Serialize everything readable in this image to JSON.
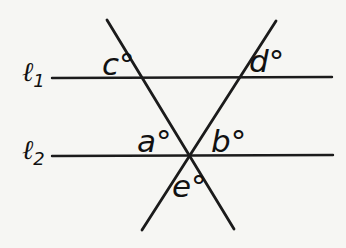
{
  "figure": {
    "canvas": {
      "width": 346,
      "height": 248,
      "background": "#f6f6f3",
      "ink": "#1b1b1b"
    },
    "parallel_lines": [
      {
        "name": "parallel-line-l1",
        "x1": 52,
        "y1": 78,
        "x2": 332,
        "y2": 77,
        "width": 2.4
      },
      {
        "name": "parallel-line-l2",
        "x1": 52,
        "y1": 156,
        "x2": 333,
        "y2": 155,
        "width": 2.4
      }
    ],
    "transversals": [
      {
        "name": "transversal-left",
        "x1": 107,
        "y1": 20,
        "x2": 234,
        "y2": 229,
        "width": 2.8
      },
      {
        "name": "transversal-right",
        "x1": 142,
        "y1": 230,
        "x2": 276,
        "y2": 21,
        "width": 2.8
      }
    ],
    "line_labels": [
      {
        "name": "line-label-l1",
        "symbol": "ℓ",
        "subscript": "1",
        "x": 22,
        "y": 81
      },
      {
        "name": "line-label-l2",
        "symbol": "ℓ",
        "subscript": "2",
        "x": 22,
        "y": 159
      }
    ],
    "angle_labels": [
      {
        "name": "angle-label-c",
        "text": "c°",
        "x": 102,
        "y": 75
      },
      {
        "name": "angle-label-d",
        "text": "d°",
        "x": 249,
        "y": 72
      },
      {
        "name": "angle-label-a",
        "text": "a°",
        "x": 137,
        "y": 152
      },
      {
        "name": "angle-label-b",
        "text": "b°",
        "x": 211,
        "y": 152
      },
      {
        "name": "angle-label-e",
        "text": "e°",
        "x": 172,
        "y": 197
      }
    ]
  }
}
